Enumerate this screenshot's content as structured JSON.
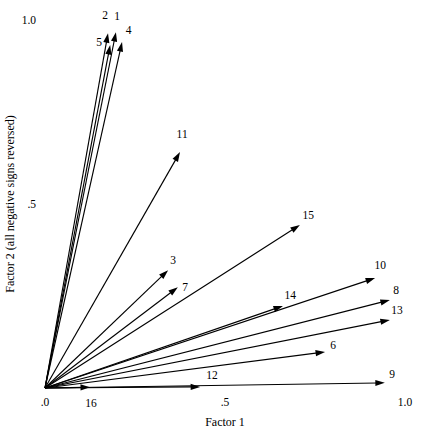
{
  "chart_data": {
    "type": "scatter",
    "subtype": "vector-loading-plot",
    "title": "",
    "xlabel": "Factor 1",
    "ylabel": "Factor 2 (all negative signs reversed)",
    "xlim": [
      0,
      1.0
    ],
    "ylim": [
      0,
      1.0
    ],
    "grid": false,
    "legend": "none",
    "xticks": [
      {
        "value": 0,
        "label": ".0"
      },
      {
        "value": 0.5,
        "label": ".5"
      },
      {
        "value": 1.0,
        "label": "1.0"
      }
    ],
    "yticks": [
      {
        "value": 0.5,
        "label": ".5"
      },
      {
        "value": 1.0,
        "label": "1.0"
      }
    ],
    "vectors": [
      {
        "label": "1",
        "x": 0.197,
        "y": 0.967,
        "label_x": 0.2,
        "label_y": 1.01
      },
      {
        "label": "2",
        "x": 0.175,
        "y": 0.964,
        "label_x": 0.167,
        "label_y": 1.013
      },
      {
        "label": "3",
        "x": 0.342,
        "y": 0.32,
        "label_x": 0.356,
        "label_y": 0.348
      },
      {
        "label": "4",
        "x": 0.214,
        "y": 0.94,
        "label_x": 0.232,
        "label_y": 0.972
      },
      {
        "label": "5",
        "x": 0.181,
        "y": 0.932,
        "label_x": 0.15,
        "label_y": 0.94
      },
      {
        "label": "6",
        "x": 0.778,
        "y": 0.098,
        "label_x": 0.8,
        "label_y": 0.118
      },
      {
        "label": "7",
        "x": 0.369,
        "y": 0.274,
        "label_x": 0.389,
        "label_y": 0.274
      },
      {
        "label": "8",
        "x": 0.958,
        "y": 0.239,
        "label_x": 0.975,
        "label_y": 0.266
      },
      {
        "label": "9",
        "x": 0.944,
        "y": 0.014,
        "label_x": 0.964,
        "label_y": 0.038
      },
      {
        "label": "10",
        "x": 0.917,
        "y": 0.299,
        "label_x": 0.931,
        "label_y": 0.334
      },
      {
        "label": "11",
        "x": 0.375,
        "y": 0.641,
        "label_x": 0.381,
        "label_y": 0.69
      },
      {
        "label": "12",
        "x": 0.431,
        "y": 0.003,
        "label_x": 0.464,
        "label_y": 0.035
      },
      {
        "label": "13",
        "x": 0.958,
        "y": 0.185,
        "label_x": 0.978,
        "label_y": 0.212
      },
      {
        "label": "14",
        "x": 0.661,
        "y": 0.223,
        "label_x": 0.681,
        "label_y": 0.253
      },
      {
        "label": "15",
        "x": 0.708,
        "y": 0.443,
        "label_x": 0.731,
        "label_y": 0.47
      },
      {
        "label": "16",
        "x": 0.125,
        "y": 0.002,
        "label_x": 0.128,
        "label_y": -0.04
      }
    ]
  }
}
